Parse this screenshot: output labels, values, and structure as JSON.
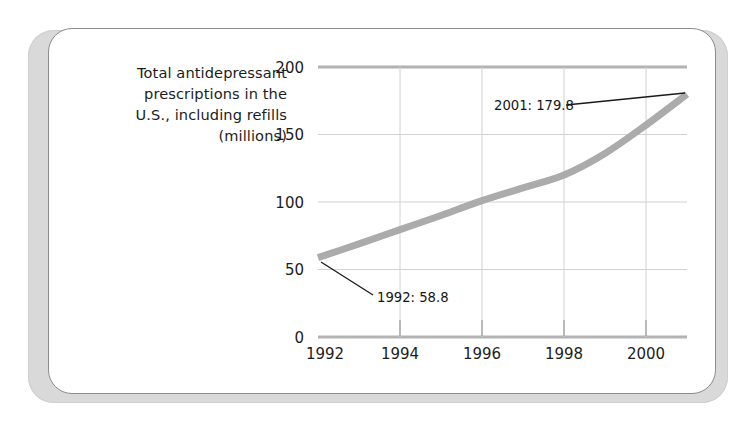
{
  "figure": {
    "background_color": "#ffffff",
    "slab_color": "#d9d9d9",
    "card_border_color": "#8c8c8c",
    "card_background": "#ffffff"
  },
  "caption": {
    "lines": [
      "Total antidepressant",
      "prescriptions in the",
      "U.S., including refills",
      "(millions)"
    ],
    "align": "right"
  },
  "chart_data": {
    "type": "line",
    "title": "Total antidepressant prescriptions in the U.S., including refills (millions)",
    "xlabel": "",
    "ylabel": "",
    "xlim": [
      1992,
      2001
    ],
    "ylim": [
      0,
      200
    ],
    "xticks": [
      1992,
      1994,
      1996,
      1998,
      2000
    ],
    "xtick_labels": [
      "1992",
      "1994",
      "1996",
      "1998",
      "2000"
    ],
    "yticks": [
      0,
      50,
      100,
      150,
      200
    ],
    "ytick_labels": [
      "0",
      "50",
      "100",
      "150",
      "200"
    ],
    "grid": "both",
    "legend": "none",
    "line_color": "#ababab",
    "line_width_px": 7,
    "x": [
      1992,
      1993,
      1994,
      1995,
      1996,
      1997,
      1998,
      1999,
      2000,
      2001
    ],
    "series": [
      {
        "name": "Total antidepressant prescriptions (millions)",
        "values": [
          58.8,
          69.0,
          79.5,
          90.0,
          101.0,
          110.5,
          120.0,
          136.0,
          157.0,
          179.8
        ]
      }
    ],
    "annotations": [
      {
        "label": "1992: 58.8",
        "year": 1992,
        "value": 58.8,
        "text_x": 377,
        "text_y": 302,
        "leader_from": [
          373,
          295
        ],
        "leader_to": [
          321,
          262
        ]
      },
      {
        "label": "2001: 179.8",
        "year": 2001,
        "value": 179.8,
        "text_x": 494,
        "text_y": 110,
        "leader_from": [
          566,
          105
        ],
        "leader_to": [
          685,
          93
        ]
      }
    ],
    "axis_line_color": "#b3b3b3",
    "grid_line_color": "#d2d2d2"
  }
}
